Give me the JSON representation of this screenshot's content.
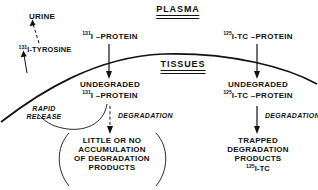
{
  "diagram": {
    "title_visible": false,
    "headers": [
      {
        "id": "plasma",
        "label": "PLASMA"
      },
      {
        "id": "tissues",
        "label": "TISSUES"
      }
    ],
    "labels": {
      "urine": "URINE",
      "i131_tyrosine_sup": "131",
      "i131_tyrosine_text": "I-TYROSINE",
      "i131_protein_sup": "131",
      "i131_protein_text": "I –PROTEIN",
      "i125_tc_protein_sup": "125",
      "i125_tc_protein_text": "I-TC –PROTEIN",
      "undegraded_left": "UNDEGRADED",
      "undegraded_left_sup": "131",
      "undegraded_left_text": "I –PROTEIN",
      "undegraded_right": "UNDEGRADED",
      "undegraded_right_sup": "125",
      "undegraded_right_text": "I-TC –PROTEIN",
      "rapid_release_line1": "RAPID",
      "rapid_release_line2": "RELEASE",
      "degradation_left": "DEGRADATION",
      "degradation_right": "DEGRADATION",
      "little_line1": "LITTLE OR NO",
      "little_line2": "ACCUMULATION",
      "little_line3": "OF DEGRADATION",
      "little_line4": "PRODUCTS",
      "trapped_line1": "TRAPPED",
      "trapped_line2": "DEGRADATION",
      "trapped_line3": "PRODUCTS",
      "trapped_sup": "125",
      "trapped_text": "I-TC"
    },
    "colors": {
      "ink": "#111111",
      "background": "#ffffff"
    }
  }
}
